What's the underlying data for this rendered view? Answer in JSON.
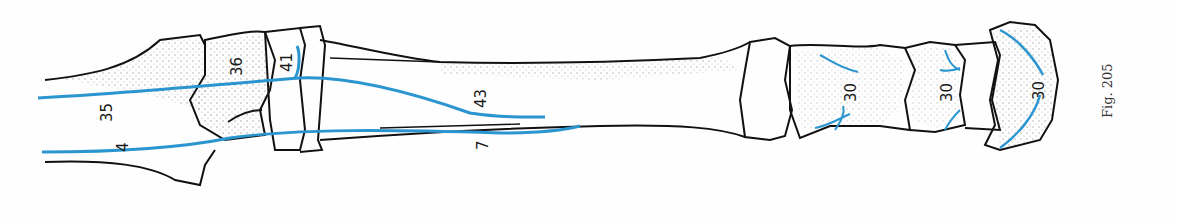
{
  "figure": {
    "caption": "Fig. 205",
    "colors": {
      "bone_outline": "#111111",
      "tendon": "#2b95d0",
      "stipple": "#555555",
      "background": "#ffffff"
    }
  },
  "labels": [
    {
      "id": "35",
      "text": "35",
      "x": 110,
      "y": 108,
      "rotate": -90
    },
    {
      "id": "36",
      "text": "36",
      "x": 238,
      "y": 60,
      "rotate": -90
    },
    {
      "id": "41",
      "text": "41",
      "x": 290,
      "y": 60,
      "rotate": -90
    },
    {
      "id": "43",
      "text": "43",
      "x": 480,
      "y": 98,
      "rotate": -90
    },
    {
      "id": "4",
      "text": "4",
      "x": 122,
      "y": 146,
      "rotate": -90
    },
    {
      "id": "7",
      "text": "7",
      "x": 482,
      "y": 147,
      "rotate": -90
    },
    {
      "id": "30a",
      "text": "30",
      "x": 850,
      "y": 92,
      "rotate": -90
    },
    {
      "id": "30b",
      "text": "30",
      "x": 946,
      "y": 92,
      "rotate": -90
    },
    {
      "id": "30c",
      "text": "30",
      "x": 1042,
      "y": 92,
      "rotate": -90
    }
  ]
}
